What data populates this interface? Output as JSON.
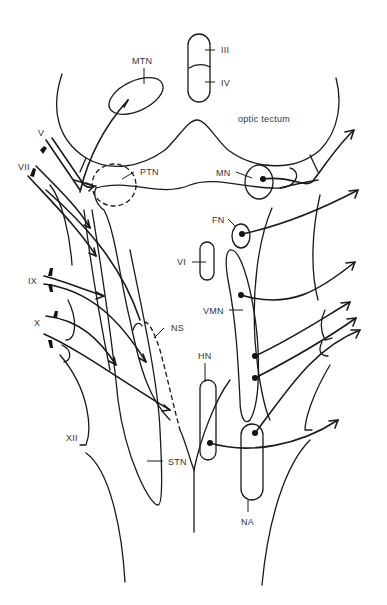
{
  "figure": {
    "type": "neuroanatomy schematic (dorsal view of brainstem cranial nerve nuclei)",
    "colors": {
      "line": "#1a1a1a",
      "label": "#333333",
      "background": "#ffffff"
    }
  },
  "labels": {
    "mtn": "MTN",
    "iii": "III",
    "iv": "IV",
    "optic_tectum": "optic tectum",
    "v": "V",
    "vii": "VII",
    "ptn": "PTN",
    "mn": "MN",
    "fn": "FN",
    "vi": "VI",
    "ix": "IX",
    "x": "X",
    "vmn": "VMN",
    "ns": "NS",
    "hn": "HN",
    "xii": "XII",
    "stn": "STN",
    "na": "NA"
  },
  "nuclei": [
    {
      "id": "MTN",
      "name": "mesencephalic trigeminal nucleus"
    },
    {
      "id": "III",
      "name": "oculomotor nucleus"
    },
    {
      "id": "IV",
      "name": "trochlear nucleus"
    },
    {
      "id": "PTN",
      "name": "principal trigeminal nucleus"
    },
    {
      "id": "MN",
      "name": "motor nucleus (trigeminal)"
    },
    {
      "id": "FN",
      "name": "facial nucleus"
    },
    {
      "id": "VI",
      "name": "abducens nucleus"
    },
    {
      "id": "VMN",
      "name": "visceral motor nucleus"
    },
    {
      "id": "NS",
      "name": "nucleus of solitary tract"
    },
    {
      "id": "HN",
      "name": "hypoglossal nucleus"
    },
    {
      "id": "STN",
      "name": "spinal trigeminal nucleus"
    },
    {
      "id": "NA",
      "name": "nucleus ambiguus"
    }
  ],
  "nerves": [
    "V",
    "VII",
    "IX",
    "X",
    "XII"
  ]
}
